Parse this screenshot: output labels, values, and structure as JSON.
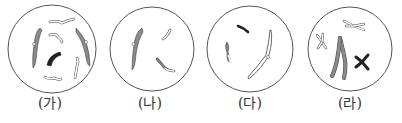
{
  "figure": {
    "panels": [
      {
        "label": "(가)",
        "description": "cell with 4 pairs of homologous chromosomes (2 large gray, 1 dark black bent, several small white)"
      },
      {
        "label": "(나)",
        "description": "cell with 3 chromosomes (1 large gray, 2 small white)"
      },
      {
        "label": "(다)",
        "description": "cell with 3 chromosomes (1 small gray, 1 small dark, 1 large white)"
      },
      {
        "label": "(라)",
        "description": "cell with replicated chromosomes (X-shaped): 1 large gray, 1 dark black, 2 small white"
      }
    ],
    "colors": {
      "gray": "#8a8a8a",
      "dark": "#222222",
      "white": "#ffffff",
      "outline": "#555555"
    }
  }
}
